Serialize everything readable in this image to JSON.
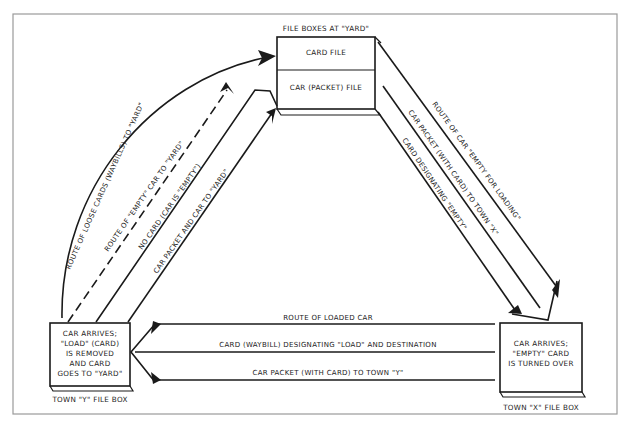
{
  "diagram": {
    "nodes": {
      "yard": {
        "caption": "FILE BOXES AT \"YARD\"",
        "sections": [
          "CARD FILE",
          "CAR (PACKET) FILE"
        ]
      },
      "town_y": {
        "caption": "TOWN \"Y\" FILE BOX",
        "lines": [
          "CAR ARRIVES;",
          "\"LOAD\" (CARD)",
          "IS REMOVED",
          "AND CARD",
          "GOES TO \"YARD\""
        ]
      },
      "town_x": {
        "caption": "TOWN \"X\" FILE BOX",
        "lines": [
          "CAR ARRIVES;",
          "\"EMPTY\" CARD",
          "IS TURNED OVER"
        ]
      }
    },
    "edges": {
      "left": [
        {
          "label": "ROUTE OF LOOSE CARDS (WAYBILLS) TO \"YARD\"",
          "style": "solid-curve"
        },
        {
          "label": "ROUTE OF \"EMPTY\" CAR TO \"YARD\"",
          "style": "dashed"
        },
        {
          "label": "NO CARD (CAR IS \"EMPTY\")",
          "style": "solid"
        },
        {
          "label": "CAR PACKET AND CAR TO \"YARD\"",
          "style": "solid"
        }
      ],
      "right": [
        {
          "label": "ROUTE OF CAR \"EMPTY FOR LOADING\"",
          "style": "solid"
        },
        {
          "label": "CAR PACKET (WITH CARD) TO TOWN \"X\"",
          "style": "solid"
        },
        {
          "label": "CARD DESIGNATING \"EMPTY\"",
          "style": "solid"
        }
      ],
      "bottom": [
        {
          "label": "ROUTE OF LOADED CAR",
          "style": "solid"
        },
        {
          "label": "CARD (WAYBILL) DESIGNATING \"LOAD\" AND DESTINATION",
          "style": "solid"
        },
        {
          "label": "CAR PACKET (WITH CARD) TO TOWN \"Y\"",
          "style": "solid"
        }
      ]
    },
    "colors": {
      "ink": "#1a1a1a",
      "border": "#9a9a9a",
      "background": "#ffffff"
    }
  }
}
